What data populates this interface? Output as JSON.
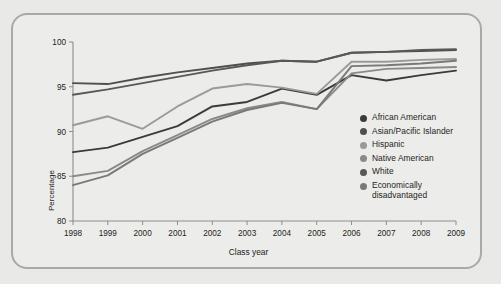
{
  "chart_data": {
    "type": "line",
    "title": "",
    "subtitle": "",
    "xlabel": "Class year",
    "ylabel": "Percentage",
    "x": [
      1998,
      1999,
      2000,
      2001,
      2002,
      2003,
      2004,
      2005,
      2006,
      2007,
      2008,
      2009
    ],
    "xtick_labels": [
      "1998",
      "1999",
      "2000",
      "2001",
      "2002",
      "2003",
      "2004",
      "2005",
      "2006",
      "2007",
      "2008",
      "2009"
    ],
    "ytick_labels": [
      "80",
      "85",
      "90",
      "95",
      "100"
    ],
    "ytick_values": [
      80,
      85,
      90,
      95,
      100
    ],
    "ylim": [
      80,
      100
    ],
    "xlim": [
      1998,
      2009
    ],
    "grid": false,
    "legend_position": "inside-right",
    "series": [
      {
        "name": "African American",
        "color": "#3b3b3b",
        "values": [
          87.7,
          88.2,
          89.4,
          90.6,
          92.8,
          93.3,
          94.8,
          94.1,
          96.3,
          95.7,
          96.3,
          96.8
        ]
      },
      {
        "name": "Asian/Pacific Islander",
        "color": "#4f4f4f",
        "values": [
          95.4,
          95.3,
          96.0,
          96.6,
          97.1,
          97.6,
          97.9,
          97.8,
          98.8,
          98.9,
          99.0,
          99.1
        ]
      },
      {
        "name": "Hispanic",
        "color": "#9a9a9a",
        "values": [
          90.7,
          91.7,
          90.3,
          92.8,
          94.8,
          95.3,
          94.9,
          94.2,
          97.8,
          97.8,
          98.0,
          98.1
        ]
      },
      {
        "name": "Native American",
        "color": "#8a8a8a",
        "values": [
          85.0,
          85.6,
          87.8,
          89.6,
          91.4,
          92.6,
          93.3,
          92.5,
          96.5,
          97.0,
          97.1,
          97.2
        ]
      },
      {
        "name": "White",
        "color": "#585858",
        "values": [
          94.1,
          94.7,
          95.4,
          96.1,
          96.8,
          97.4,
          97.9,
          97.8,
          98.8,
          98.9,
          99.1,
          99.2
        ]
      },
      {
        "name": "Economically\ndisadvantaged",
        "color": "#797979",
        "values": [
          84.0,
          85.1,
          87.5,
          89.3,
          91.1,
          92.4,
          93.2,
          92.5,
          97.3,
          97.4,
          97.6,
          97.9
        ]
      }
    ]
  },
  "legend": {
    "items": [
      {
        "label": "African American",
        "color": "#3b3b3b"
      },
      {
        "label": "Asian/Pacific Islander",
        "color": "#4f4f4f"
      },
      {
        "label": "Hispanic",
        "color": "#9a9a9a"
      },
      {
        "label": "Native American",
        "color": "#8a8a8a"
      },
      {
        "label": "White",
        "color": "#585858"
      },
      {
        "label": "Economically\ndisadvantaged",
        "color": "#797979"
      }
    ]
  },
  "axes": {
    "y_title": "Percentage",
    "x_title": "Class year"
  },
  "theme": {
    "figure_background": "#ececea",
    "page_background": "#e9e9e7",
    "frame_border": "#a9a9a7",
    "axis_color": "#8d8d8b",
    "text_color": "#1d1d1b"
  }
}
